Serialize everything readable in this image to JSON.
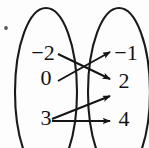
{
  "figure": {
    "type": "mapping-diagram",
    "width": 149,
    "height": 148,
    "background_color": "#fdfdfd",
    "ink_color": "#151515"
  },
  "domain_oval": {
    "name": "domain",
    "cx": 46,
    "cy": 92,
    "rx": 31,
    "ry": 84,
    "elements": [
      {
        "label": "−2",
        "x": 43,
        "y": 60
      },
      {
        "label": "0",
        "x": 46,
        "y": 85
      },
      {
        "label": "3",
        "x": 46,
        "y": 125
      }
    ]
  },
  "range_oval": {
    "name": "range",
    "cx": 119,
    "cy": 92,
    "rx": 31,
    "ry": 84,
    "elements": [
      {
        "label": "−1",
        "x": 124,
        "y": 60
      },
      {
        "label": "2",
        "x": 124,
        "y": 88
      },
      {
        "label": "4",
        "x": 124,
        "y": 126
      }
    ]
  },
  "mappings": [
    {
      "from": "−2",
      "to": "2",
      "x1": 58,
      "y1": 54,
      "x2": 110,
      "y2": 79
    },
    {
      "from": "0",
      "to": "−1",
      "x1": 58,
      "y1": 81,
      "x2": 110,
      "y2": 52
    },
    {
      "from": "3",
      "to": "2",
      "x1": 52,
      "y1": 119,
      "x2": 110,
      "y2": 96
    },
    {
      "from": "3",
      "to": "4",
      "x1": 52,
      "y1": 121,
      "x2": 110,
      "y2": 121
    }
  ],
  "artifacts": {
    "speck": {
      "name": "scan-speck",
      "cx": 6,
      "cy": 28,
      "r": 2
    }
  },
  "legend": {
    "domain_label": "Domain",
    "range_label": "Range"
  }
}
